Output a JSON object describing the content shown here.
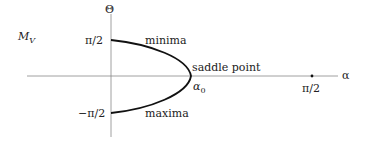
{
  "diagram": {
    "y_axis_label": "Θ",
    "x_axis_label": "α",
    "function_label_main": "M",
    "function_label_sub": "V",
    "ticks": {
      "y_top": "π/2",
      "y_bottom": "−π/2",
      "x_right": "π/2"
    },
    "annotations": {
      "minima": "minima",
      "saddle_point": "saddle point",
      "alpha0_main": "α",
      "alpha0_sub": "0",
      "maxima": "maxima"
    },
    "colors": {
      "axis": "#888888",
      "curve": "#111111",
      "text": "#222222"
    }
  }
}
